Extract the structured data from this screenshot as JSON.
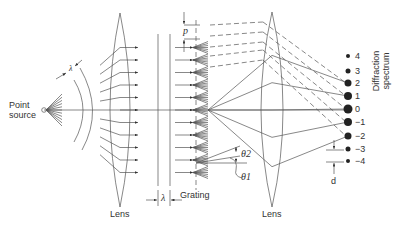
{
  "diagram": {
    "labels": {
      "point_source": [
        "Point",
        "source"
      ],
      "lens_left": "Lens",
      "lens_right": "Lens",
      "grating": "Grating",
      "wavelength": "λ",
      "period": "p",
      "spot_spacing": "d",
      "theta1": "θ1",
      "theta2": "θ2",
      "spectrum": [
        "Diffraction",
        "spectrum"
      ]
    },
    "orders": [
      {
        "label": "4",
        "y": 56,
        "r": 2
      },
      {
        "label": "3",
        "y": 71,
        "r": 2.5
      },
      {
        "label": "2",
        "y": 83,
        "r": 3.5
      },
      {
        "label": "1",
        "y": 96,
        "r": 4
      },
      {
        "label": "0",
        "y": 109,
        "r": 4.5
      },
      {
        "label": "−1",
        "y": 122,
        "r": 4
      },
      {
        "label": "−2",
        "y": 136,
        "r": 3.5
      },
      {
        "label": "−3",
        "y": 149,
        "r": 2.5
      },
      {
        "label": "−4",
        "y": 161,
        "r": 2
      }
    ],
    "colors": {
      "line": "#444444",
      "background": "#ffffff"
    }
  }
}
